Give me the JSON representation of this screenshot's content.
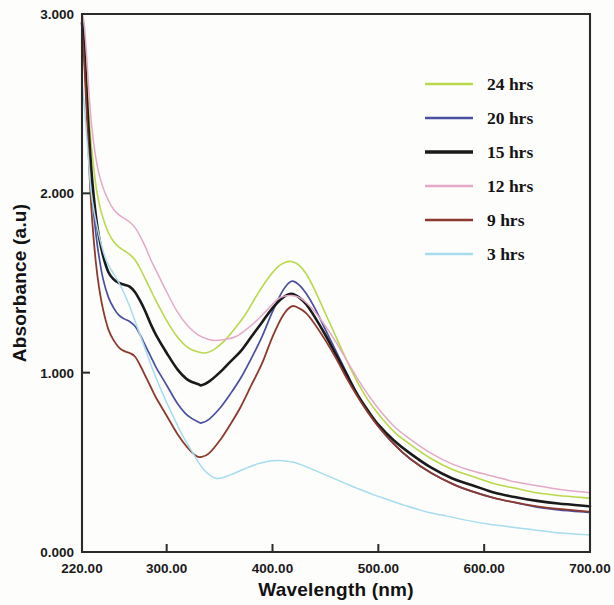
{
  "chart_data": {
    "type": "line",
    "title": "",
    "xlabel": "Wavelength (nm)",
    "ylabel": "Absorbance (a.u)",
    "xlim": [
      220,
      700
    ],
    "ylim": [
      0.0,
      3.0
    ],
    "xticks": [
      220,
      300,
      400,
      500,
      600,
      700
    ],
    "xticklabels": [
      "220.00",
      "300.00",
      "400.00",
      "500.00",
      "600.00",
      "700.00"
    ],
    "yticks": [
      0.0,
      1.0,
      2.0,
      3.0
    ],
    "yticklabels": [
      "0.000",
      "1.000",
      "2.000",
      "3.000"
    ],
    "grid": false,
    "legend_position": "upper right",
    "series": [
      {
        "name": "24 hrs",
        "color": "#b9d94a",
        "width": 1.6,
        "peak_wavelength": 418,
        "peak_absorbance": 1.62,
        "valley_wavelength": 337,
        "valley_absorbance": 1.11,
        "x": [
          220,
          222,
          224,
          226,
          228,
          230,
          233,
          236,
          240,
          245,
          250,
          255,
          260,
          265,
          270,
          275,
          280,
          285,
          290,
          300,
          310,
          320,
          330,
          337,
          345,
          355,
          365,
          375,
          385,
          395,
          405,
          412,
          418,
          425,
          432,
          440,
          450,
          460,
          470,
          480,
          490,
          500,
          515,
          530,
          550,
          570,
          590,
          610,
          630,
          650,
          670,
          700
        ],
        "y": [
          3.0,
          2.92,
          2.72,
          2.5,
          2.32,
          2.2,
          2.05,
          1.95,
          1.86,
          1.78,
          1.73,
          1.7,
          1.68,
          1.66,
          1.63,
          1.58,
          1.52,
          1.46,
          1.4,
          1.29,
          1.2,
          1.14,
          1.115,
          1.11,
          1.13,
          1.18,
          1.25,
          1.33,
          1.43,
          1.52,
          1.59,
          1.615,
          1.62,
          1.6,
          1.55,
          1.46,
          1.33,
          1.2,
          1.07,
          0.95,
          0.85,
          0.77,
          0.67,
          0.6,
          0.52,
          0.46,
          0.42,
          0.38,
          0.355,
          0.33,
          0.315,
          0.3
        ]
      },
      {
        "name": "20 hrs",
        "color": "#4a4fa0",
        "width": 1.7,
        "peak_wavelength": 418,
        "peak_absorbance": 1.51,
        "valley_wavelength": 333,
        "valley_absorbance": 0.72,
        "x": [
          220,
          222,
          224,
          226,
          228,
          230,
          233,
          236,
          240,
          245,
          250,
          255,
          260,
          265,
          270,
          275,
          280,
          285,
          290,
          300,
          310,
          320,
          330,
          333,
          340,
          350,
          360,
          370,
          380,
          390,
          400,
          410,
          418,
          425,
          432,
          440,
          450,
          460,
          470,
          480,
          490,
          500,
          515,
          530,
          550,
          570,
          590,
          610,
          630,
          650,
          670,
          700
        ],
        "y": [
          2.98,
          2.85,
          2.6,
          2.35,
          2.12,
          1.96,
          1.78,
          1.65,
          1.52,
          1.42,
          1.36,
          1.32,
          1.3,
          1.285,
          1.26,
          1.21,
          1.15,
          1.09,
          1.03,
          0.93,
          0.83,
          0.76,
          0.725,
          0.72,
          0.74,
          0.8,
          0.88,
          0.97,
          1.08,
          1.2,
          1.34,
          1.46,
          1.51,
          1.49,
          1.44,
          1.36,
          1.24,
          1.12,
          1.0,
          0.88,
          0.78,
          0.7,
          0.6,
          0.52,
          0.44,
          0.38,
          0.335,
          0.3,
          0.275,
          0.25,
          0.235,
          0.22
        ]
      },
      {
        "name": "15 hrs",
        "color": "#1a1a1a",
        "width": 2.6,
        "peak_wavelength": 418,
        "peak_absorbance": 1.44,
        "valley_wavelength": 333,
        "valley_absorbance": 0.93,
        "x": [
          220,
          222,
          224,
          226,
          228,
          230,
          233,
          236,
          240,
          245,
          250,
          255,
          260,
          265,
          270,
          275,
          280,
          285,
          290,
          300,
          310,
          320,
          330,
          333,
          340,
          350,
          360,
          370,
          380,
          390,
          400,
          410,
          418,
          425,
          432,
          440,
          450,
          460,
          470,
          480,
          490,
          500,
          515,
          530,
          550,
          570,
          590,
          610,
          630,
          650,
          670,
          700
        ],
        "y": [
          2.95,
          2.82,
          2.6,
          2.38,
          2.2,
          2.05,
          1.88,
          1.76,
          1.65,
          1.56,
          1.52,
          1.5,
          1.49,
          1.48,
          1.45,
          1.4,
          1.34,
          1.27,
          1.21,
          1.11,
          1.02,
          0.96,
          0.935,
          0.93,
          0.95,
          1.0,
          1.06,
          1.12,
          1.2,
          1.28,
          1.36,
          1.42,
          1.44,
          1.42,
          1.38,
          1.31,
          1.21,
          1.1,
          0.99,
          0.88,
          0.79,
          0.71,
          0.62,
          0.55,
          0.47,
          0.41,
          0.37,
          0.33,
          0.305,
          0.285,
          0.27,
          0.255
        ]
      },
      {
        "name": "12 hrs",
        "color": "#e4a9c8",
        "width": 1.5,
        "peak_wavelength": 418,
        "peak_absorbance": 1.43,
        "valley_wavelength": 345,
        "valley_absorbance": 1.18,
        "x": [
          220,
          222,
          224,
          226,
          228,
          230,
          233,
          236,
          240,
          245,
          250,
          255,
          260,
          265,
          270,
          275,
          280,
          285,
          290,
          300,
          310,
          320,
          330,
          340,
          345,
          355,
          365,
          375,
          385,
          395,
          405,
          412,
          418,
          425,
          432,
          440,
          450,
          460,
          470,
          480,
          490,
          500,
          515,
          530,
          550,
          570,
          590,
          610,
          630,
          650,
          670,
          700
        ],
        "y": [
          3.0,
          2.95,
          2.8,
          2.62,
          2.45,
          2.33,
          2.2,
          2.11,
          2.03,
          1.96,
          1.91,
          1.88,
          1.86,
          1.84,
          1.81,
          1.76,
          1.7,
          1.63,
          1.57,
          1.45,
          1.34,
          1.26,
          1.21,
          1.185,
          1.18,
          1.185,
          1.2,
          1.24,
          1.29,
          1.35,
          1.41,
          1.428,
          1.43,
          1.42,
          1.39,
          1.34,
          1.26,
          1.17,
          1.07,
          0.97,
          0.88,
          0.8,
          0.7,
          0.63,
          0.55,
          0.49,
          0.45,
          0.42,
          0.39,
          0.37,
          0.35,
          0.33
        ]
      },
      {
        "name": "9 hrs",
        "color": "#8d3a2e",
        "width": 1.8,
        "peak_wavelength": 418,
        "peak_absorbance": 1.37,
        "valley_wavelength": 330,
        "valley_absorbance": 0.53,
        "x": [
          220,
          222,
          224,
          226,
          228,
          230,
          233,
          236,
          240,
          245,
          250,
          255,
          260,
          265,
          270,
          275,
          280,
          285,
          290,
          300,
          310,
          320,
          328,
          333,
          340,
          350,
          360,
          370,
          380,
          390,
          400,
          410,
          418,
          425,
          432,
          440,
          450,
          460,
          470,
          480,
          490,
          500,
          515,
          530,
          550,
          570,
          590,
          610,
          630,
          650,
          670,
          700
        ],
        "y": [
          2.9,
          2.75,
          2.5,
          2.25,
          2.0,
          1.82,
          1.62,
          1.48,
          1.35,
          1.24,
          1.18,
          1.14,
          1.12,
          1.11,
          1.09,
          1.04,
          0.98,
          0.92,
          0.86,
          0.76,
          0.66,
          0.58,
          0.535,
          0.53,
          0.55,
          0.62,
          0.71,
          0.81,
          0.93,
          1.05,
          1.2,
          1.32,
          1.37,
          1.36,
          1.33,
          1.27,
          1.18,
          1.08,
          0.97,
          0.87,
          0.78,
          0.7,
          0.6,
          0.52,
          0.44,
          0.38,
          0.335,
          0.3,
          0.275,
          0.255,
          0.24,
          0.225
        ]
      },
      {
        "name": "3 hrs",
        "color": "#a7dced",
        "width": 1.5,
        "peak_wavelength": 404,
        "peak_absorbance": 0.51,
        "valley_wavelength": 347,
        "valley_absorbance": 0.41,
        "x": [
          220,
          222,
          224,
          226,
          228,
          230,
          234,
          238,
          242,
          246,
          250,
          255,
          260,
          265,
          270,
          278,
          286,
          295,
          305,
          315,
          325,
          335,
          347,
          360,
          372,
          385,
          395,
          404,
          412,
          420,
          430,
          440,
          450,
          460,
          470,
          480,
          495,
          510,
          525,
          545,
          565,
          585,
          605,
          625,
          645,
          665,
          685,
          700
        ],
        "y": [
          2.62,
          2.5,
          2.35,
          2.2,
          2.05,
          1.95,
          1.82,
          1.72,
          1.64,
          1.59,
          1.55,
          1.5,
          1.44,
          1.37,
          1.29,
          1.16,
          1.03,
          0.9,
          0.77,
          0.65,
          0.55,
          0.46,
          0.41,
          0.43,
          0.46,
          0.49,
          0.505,
          0.51,
          0.508,
          0.5,
          0.48,
          0.455,
          0.43,
          0.405,
          0.38,
          0.355,
          0.32,
          0.29,
          0.26,
          0.225,
          0.2,
          0.175,
          0.155,
          0.14,
          0.125,
          0.11,
          0.1,
          0.095
        ]
      }
    ]
  },
  "legend": {
    "entries": [
      {
        "label": "24 hrs",
        "color": "#b9d94a"
      },
      {
        "label": "20 hrs",
        "color": "#4a4fa0"
      },
      {
        "label": "15 hrs",
        "color": "#1a1a1a"
      },
      {
        "label": "12 hrs",
        "color": "#e4a9c8"
      },
      {
        "label": "9 hrs",
        "color": "#8d3a2e"
      },
      {
        "label": "3 hrs",
        "color": "#a7dced"
      }
    ]
  }
}
